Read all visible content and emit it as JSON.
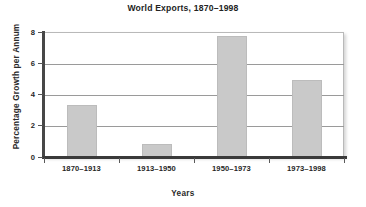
{
  "chart_data": {
    "type": "bar",
    "title": "World Exports, 1870–1998",
    "xlabel": "Years",
    "ylabel": "Percentage Growth per Annum",
    "categories": [
      "1870–1913",
      "1913–1950",
      "1950–1973",
      "1973–1998"
    ],
    "values": [
      3.4,
      0.9,
      7.8,
      5.0
    ],
    "ylim": [
      0,
      8
    ],
    "yticks": [
      0,
      2,
      4,
      6,
      8
    ],
    "ytick_labels": [
      "0",
      "2",
      "4",
      "6",
      "8"
    ],
    "grid": "horizontal",
    "legend": "none",
    "bar_color": "#c9c9c9",
    "axis_color": "#3a3a3a",
    "gridline_color": "#9a9a9a"
  }
}
